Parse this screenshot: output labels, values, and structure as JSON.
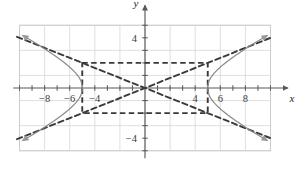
{
  "figure": {
    "kind": "hyperbola-graph",
    "axis_labels": {
      "x": "x",
      "y": "y"
    },
    "colors": {
      "grid": "#d8d8d8",
      "grid_border": "#c9c9c9",
      "axis": "#58595b",
      "curve": "#8b8b8b",
      "dashed": "#3a3a3a",
      "text": "#3b3b3b",
      "background": "#ffffff"
    }
  },
  "chart_data": {
    "type": "line",
    "title": "",
    "xlabel": "x",
    "ylabel": "y",
    "xlim": [
      -10,
      10
    ],
    "ylim": [
      -5.5,
      5.5
    ],
    "grid": true,
    "legend": "none",
    "xticks": [
      -8,
      -6,
      -4,
      4,
      6,
      8
    ],
    "xtick_labels": [
      "−8",
      "−6",
      "−4",
      "4",
      "6",
      "8"
    ],
    "yticks": [
      4,
      -4
    ],
    "ytick_labels": [
      "4",
      "−4"
    ],
    "tick_interval": 1,
    "grid_interval": 2,
    "equation": "x^2/25 - y^2/4 = 1",
    "center": [
      0,
      0
    ],
    "a": 5,
    "b": 2,
    "vertices": [
      [
        -5,
        0
      ],
      [
        5,
        0
      ]
    ],
    "asymptote_slopes": [
      0.4,
      -0.4
    ],
    "central_rectangle": {
      "x_min": -5,
      "x_max": 5,
      "y_min": -2,
      "y_max": 2
    },
    "series": [
      {
        "name": "right-branch",
        "style": "solid",
        "color": "#8b8b8b",
        "arrows": [
          "start",
          "end"
        ],
        "points": [
          [
            9.6,
            4.1
          ],
          [
            9.0,
            3.74
          ],
          [
            8.4,
            3.38
          ],
          [
            7.8,
            2.99
          ],
          [
            7.2,
            2.59
          ],
          [
            6.6,
            2.16
          ],
          [
            6.2,
            1.84
          ],
          [
            5.8,
            1.48
          ],
          [
            5.5,
            1.17
          ],
          [
            5.25,
            0.84
          ],
          [
            5.1,
            0.57
          ],
          [
            5.02,
            0.25
          ],
          [
            5.0,
            0.0
          ],
          [
            5.02,
            -0.25
          ],
          [
            5.1,
            -0.57
          ],
          [
            5.25,
            -0.84
          ],
          [
            5.5,
            -1.17
          ],
          [
            5.8,
            -1.48
          ],
          [
            6.2,
            -1.84
          ],
          [
            6.6,
            -2.16
          ],
          [
            7.2,
            -2.59
          ],
          [
            7.8,
            -2.99
          ],
          [
            8.4,
            -3.38
          ],
          [
            9.0,
            -3.74
          ],
          [
            9.6,
            -4.1
          ]
        ]
      },
      {
        "name": "left-branch",
        "style": "solid",
        "color": "#8b8b8b",
        "arrows": [
          "start",
          "end"
        ],
        "points": [
          [
            -9.6,
            4.1
          ],
          [
            -9.0,
            3.74
          ],
          [
            -8.4,
            3.38
          ],
          [
            -7.8,
            2.99
          ],
          [
            -7.2,
            2.59
          ],
          [
            -6.6,
            2.16
          ],
          [
            -6.2,
            1.84
          ],
          [
            -5.8,
            1.48
          ],
          [
            -5.5,
            1.17
          ],
          [
            -5.25,
            0.84
          ],
          [
            -5.1,
            0.57
          ],
          [
            -5.02,
            0.25
          ],
          [
            -5.0,
            0.0
          ],
          [
            -5.02,
            -0.25
          ],
          [
            -5.1,
            -0.57
          ],
          [
            -5.25,
            -0.84
          ],
          [
            -5.5,
            -1.17
          ],
          [
            -5.8,
            -1.48
          ],
          [
            -6.2,
            -1.84
          ],
          [
            -6.6,
            -2.16
          ],
          [
            -7.2,
            -2.59
          ],
          [
            -7.8,
            -2.99
          ],
          [
            -8.4,
            -3.38
          ],
          [
            -9.0,
            -3.74
          ],
          [
            -9.6,
            -4.1
          ]
        ]
      },
      {
        "name": "asymptote-positive",
        "style": "dashed",
        "color": "#3a3a3a",
        "arrows": [],
        "points": [
          [
            -10.2,
            -4.08
          ],
          [
            10.2,
            4.08
          ]
        ]
      },
      {
        "name": "asymptote-negative",
        "style": "dashed",
        "color": "#3a3a3a",
        "arrows": [],
        "points": [
          [
            -10.2,
            4.08
          ],
          [
            10.2,
            -4.08
          ]
        ]
      }
    ]
  }
}
